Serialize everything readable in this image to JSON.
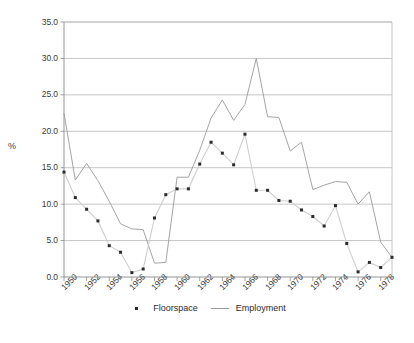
{
  "chart_data": {
    "type": "line",
    "title": "",
    "xlabel": "",
    "ylabel": "%",
    "ylim": [
      0.0,
      35.0
    ],
    "xlim": [
      1950,
      1979
    ],
    "ytick_labels": [
      "0.0",
      "5.0",
      "10.0",
      "15.0",
      "20.0",
      "25.0",
      "30.0",
      "35.0"
    ],
    "ytick_values": [
      0.0,
      5.0,
      10.0,
      15.0,
      20.0,
      25.0,
      30.0,
      35.0
    ],
    "xtick_labels": [
      "1950",
      "1952",
      "1954",
      "1956",
      "1958",
      "1960",
      "1962",
      "1964",
      "1966",
      "1968",
      "1970",
      "1972",
      "1974",
      "1976",
      "1978"
    ],
    "xtick_values": [
      1950,
      1952,
      1954,
      1956,
      1958,
      1960,
      1962,
      1964,
      1966,
      1968,
      1970,
      1972,
      1974,
      1976,
      1978
    ],
    "minor_ticks_every": 1,
    "grid": "horizontal",
    "legend_position": "bottom-center",
    "x": [
      1950,
      1951,
      1952,
      1953,
      1954,
      1955,
      1956,
      1957,
      1958,
      1959,
      1960,
      1961,
      1962,
      1963,
      1964,
      1965,
      1966,
      1967,
      1968,
      1969,
      1970,
      1971,
      1972,
      1973,
      1974,
      1975,
      1976,
      1977,
      1978,
      1979
    ],
    "series": [
      {
        "name": "Floorspace",
        "style": "markers-with-thin-line",
        "color": "#2b2b2b",
        "values": [
          14.4,
          10.9,
          9.3,
          7.7,
          4.3,
          3.4,
          0.6,
          1.1,
          8.1,
          11.3,
          12.1,
          12.1,
          15.5,
          18.5,
          17.0,
          15.4,
          19.6,
          11.9,
          11.9,
          10.5,
          10.4,
          9.2,
          8.3,
          7.0,
          9.8,
          4.6,
          0.7,
          2.0,
          1.3,
          2.7
        ]
      },
      {
        "name": "Employment",
        "style": "line",
        "color": "#9a9a9a",
        "values": [
          22.5,
          13.3,
          15.6,
          13.2,
          10.4,
          7.3,
          6.6,
          6.5,
          1.9,
          2.0,
          13.7,
          13.7,
          17.4,
          21.8,
          24.3,
          21.5,
          23.7,
          30.0,
          22.0,
          21.9,
          17.3,
          18.5,
          12.0,
          12.6,
          13.1,
          13.0,
          10.0,
          11.7,
          4.8,
          2.7
        ]
      }
    ]
  },
  "legend": {
    "entries": [
      {
        "label": "Floorspace",
        "marker": "square-marker"
      },
      {
        "label": "Employment",
        "marker": "line-swatch"
      }
    ]
  },
  "axes": {
    "y_axis_title": "%"
  }
}
